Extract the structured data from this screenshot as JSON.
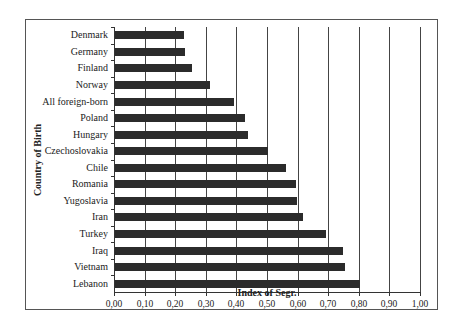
{
  "chart_data": {
    "type": "bar",
    "orientation": "horizontal",
    "title": "",
    "xlabel": "Index of Segr.",
    "ylabel": "Country of Birth",
    "xlim": [
      0,
      1.0
    ],
    "x_ticks": [
      "0,00",
      "0,10",
      "0,20",
      "0,30",
      "0,40",
      "0,50",
      "0,60",
      "0,70",
      "0,80",
      "0,90",
      "1,00"
    ],
    "grid": "vertical",
    "legend": "none",
    "categories": [
      "Denmark",
      "Germany",
      "Finland",
      "Norway",
      "All foreign-born",
      "Poland",
      "Hungary",
      "Czechoslovakia",
      "Chile",
      "Romania",
      "Yugoslavia",
      "Iran",
      "Turkey",
      "Iraq",
      "Vietnam",
      "Lebanon"
    ],
    "values": [
      0.225,
      0.23,
      0.25,
      0.31,
      0.39,
      0.425,
      0.435,
      0.5,
      0.56,
      0.59,
      0.595,
      0.615,
      0.69,
      0.745,
      0.75,
      0.8
    ],
    "bar_color": "#2b2b2b"
  }
}
